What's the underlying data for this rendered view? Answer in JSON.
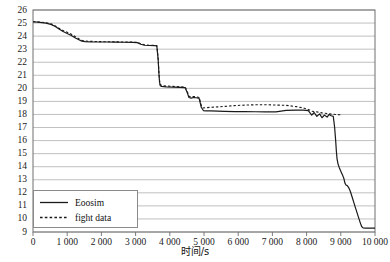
{
  "chart_data": {
    "type": "line",
    "title": "",
    "xlabel": "时间/s",
    "ylabel": "",
    "xlim": [
      0,
      10000
    ],
    "ylim": [
      9,
      26
    ],
    "grid": true,
    "grid_axis": "y",
    "legend_position": "bottom-left",
    "xticks": [
      0,
      1000,
      2000,
      3000,
      4000,
      5000,
      6000,
      7000,
      8000,
      9000,
      10000
    ],
    "xticklabels": [
      "0",
      "1 000",
      "2 000",
      "3 000",
      "4 000",
      "5 000",
      "6 000",
      "7 000",
      "8 000",
      "9 000",
      "10 000"
    ],
    "yticks": [
      9,
      10,
      11,
      12,
      13,
      14,
      15,
      16,
      17,
      18,
      19,
      20,
      21,
      22,
      23,
      24,
      25,
      26
    ],
    "yticklabels": [
      "9",
      "10",
      "11",
      "12",
      "13",
      "14",
      "15",
      "16",
      "17",
      "18",
      "19",
      "20",
      "21",
      "22",
      "23",
      "24",
      "25",
      "26"
    ],
    "series": [
      {
        "name": "Eoosim",
        "style": "solid",
        "color": "#1a1a1a",
        "points": [
          [
            0,
            25.1
          ],
          [
            200,
            25.05
          ],
          [
            380,
            25.0
          ],
          [
            520,
            24.9
          ],
          [
            640,
            24.75
          ],
          [
            760,
            24.55
          ],
          [
            880,
            24.35
          ],
          [
            1000,
            24.2
          ],
          [
            1120,
            24.05
          ],
          [
            1240,
            23.85
          ],
          [
            1340,
            23.72
          ],
          [
            1430,
            23.62
          ],
          [
            1520,
            23.58
          ],
          [
            1700,
            23.56
          ],
          [
            1900,
            23.55
          ],
          [
            2150,
            23.55
          ],
          [
            2400,
            23.54
          ],
          [
            2650,
            23.53
          ],
          [
            2900,
            23.52
          ],
          [
            3050,
            23.5
          ],
          [
            3150,
            23.38
          ],
          [
            3260,
            23.3
          ],
          [
            3400,
            23.28
          ],
          [
            3560,
            23.27
          ],
          [
            3620,
            23.26
          ],
          [
            3660,
            22.2
          ],
          [
            3680,
            21.2
          ],
          [
            3700,
            20.5
          ],
          [
            3720,
            20.2
          ],
          [
            3760,
            20.15
          ],
          [
            3900,
            20.12
          ],
          [
            4100,
            20.1
          ],
          [
            4300,
            20.08
          ],
          [
            4450,
            20.05
          ],
          [
            4520,
            19.6
          ],
          [
            4560,
            19.3
          ],
          [
            4620,
            19.25
          ],
          [
            4700,
            19.3
          ],
          [
            4780,
            19.28
          ],
          [
            4860,
            19.22
          ],
          [
            4920,
            18.55
          ],
          [
            4980,
            18.3
          ],
          [
            5060,
            18.28
          ],
          [
            5200,
            18.27
          ],
          [
            5400,
            18.25
          ],
          [
            5600,
            18.24
          ],
          [
            5900,
            18.22
          ],
          [
            6200,
            18.22
          ],
          [
            6500,
            18.21
          ],
          [
            6800,
            18.2
          ],
          [
            7100,
            18.2
          ],
          [
            7400,
            18.32
          ],
          [
            7700,
            18.33
          ],
          [
            7900,
            18.33
          ],
          [
            8050,
            18.3
          ],
          [
            8150,
            17.95
          ],
          [
            8220,
            18.15
          ],
          [
            8300,
            17.85
          ],
          [
            8380,
            18.05
          ],
          [
            8450,
            17.75
          ],
          [
            8520,
            17.95
          ],
          [
            8600,
            17.8
          ],
          [
            8660,
            18.0
          ],
          [
            8720,
            17.9
          ],
          [
            8780,
            17.85
          ],
          [
            8820,
            17.0
          ],
          [
            8850,
            16.0
          ],
          [
            8870,
            15.2
          ],
          [
            8890,
            14.6
          ],
          [
            8920,
            14.2
          ],
          [
            8960,
            13.9
          ],
          [
            9010,
            13.6
          ],
          [
            9060,
            13.3
          ],
          [
            9090,
            13.1
          ],
          [
            9120,
            12.75
          ],
          [
            9150,
            12.6
          ],
          [
            9190,
            12.55
          ],
          [
            9230,
            12.4
          ],
          [
            9280,
            12.1
          ],
          [
            9340,
            11.6
          ],
          [
            9400,
            11.1
          ],
          [
            9460,
            10.6
          ],
          [
            9520,
            10.1
          ],
          [
            9570,
            9.7
          ],
          [
            9610,
            9.42
          ],
          [
            9650,
            9.32
          ],
          [
            9720,
            9.3
          ],
          [
            9850,
            9.3
          ],
          [
            10000,
            9.3
          ]
        ]
      },
      {
        "name": "fight data",
        "style": "dashed",
        "color": "#1a1a1a",
        "points": [
          [
            0,
            25.1
          ],
          [
            200,
            25.08
          ],
          [
            380,
            25.02
          ],
          [
            520,
            24.95
          ],
          [
            640,
            24.8
          ],
          [
            760,
            24.6
          ],
          [
            880,
            24.42
          ],
          [
            1000,
            24.3
          ],
          [
            1120,
            24.15
          ],
          [
            1240,
            23.95
          ],
          [
            1340,
            23.8
          ],
          [
            1430,
            23.68
          ],
          [
            1520,
            23.62
          ],
          [
            1700,
            23.6
          ],
          [
            1900,
            23.58
          ],
          [
            2150,
            23.57
          ],
          [
            2400,
            23.56
          ],
          [
            2650,
            23.55
          ],
          [
            2900,
            23.54
          ],
          [
            3050,
            23.52
          ],
          [
            3150,
            23.42
          ],
          [
            3260,
            23.34
          ],
          [
            3400,
            23.3
          ],
          [
            3560,
            23.29
          ],
          [
            3620,
            23.28
          ],
          [
            3660,
            22.3
          ],
          [
            3680,
            21.3
          ],
          [
            3700,
            20.6
          ],
          [
            3720,
            20.3
          ],
          [
            3760,
            20.22
          ],
          [
            3900,
            20.18
          ],
          [
            4100,
            20.15
          ],
          [
            4300,
            20.12
          ],
          [
            4450,
            20.1
          ],
          [
            4520,
            19.7
          ],
          [
            4560,
            19.4
          ],
          [
            4620,
            19.35
          ],
          [
            4700,
            19.38
          ],
          [
            4780,
            19.35
          ],
          [
            4860,
            19.3
          ],
          [
            4920,
            18.7
          ],
          [
            4980,
            18.5
          ],
          [
            5060,
            18.52
          ],
          [
            5200,
            18.55
          ],
          [
            5400,
            18.58
          ],
          [
            5600,
            18.62
          ],
          [
            5900,
            18.68
          ],
          [
            6200,
            18.72
          ],
          [
            6500,
            18.74
          ],
          [
            6800,
            18.75
          ],
          [
            7100,
            18.72
          ],
          [
            7400,
            18.7
          ],
          [
            7700,
            18.6
          ],
          [
            7900,
            18.5
          ],
          [
            8050,
            18.38
          ],
          [
            8150,
            18.25
          ],
          [
            8300,
            18.2
          ],
          [
            8450,
            18.12
          ],
          [
            8600,
            18.08
          ],
          [
            8750,
            18.02
          ],
          [
            8850,
            18.0
          ],
          [
            8950,
            17.98
          ],
          [
            9000,
            17.97
          ]
        ]
      }
    ]
  },
  "legend": {
    "entries": [
      {
        "label": "Eoosim",
        "style": "solid"
      },
      {
        "label": "fight data",
        "style": "dashed"
      }
    ]
  },
  "axes": {
    "x_title": "时间/s"
  }
}
